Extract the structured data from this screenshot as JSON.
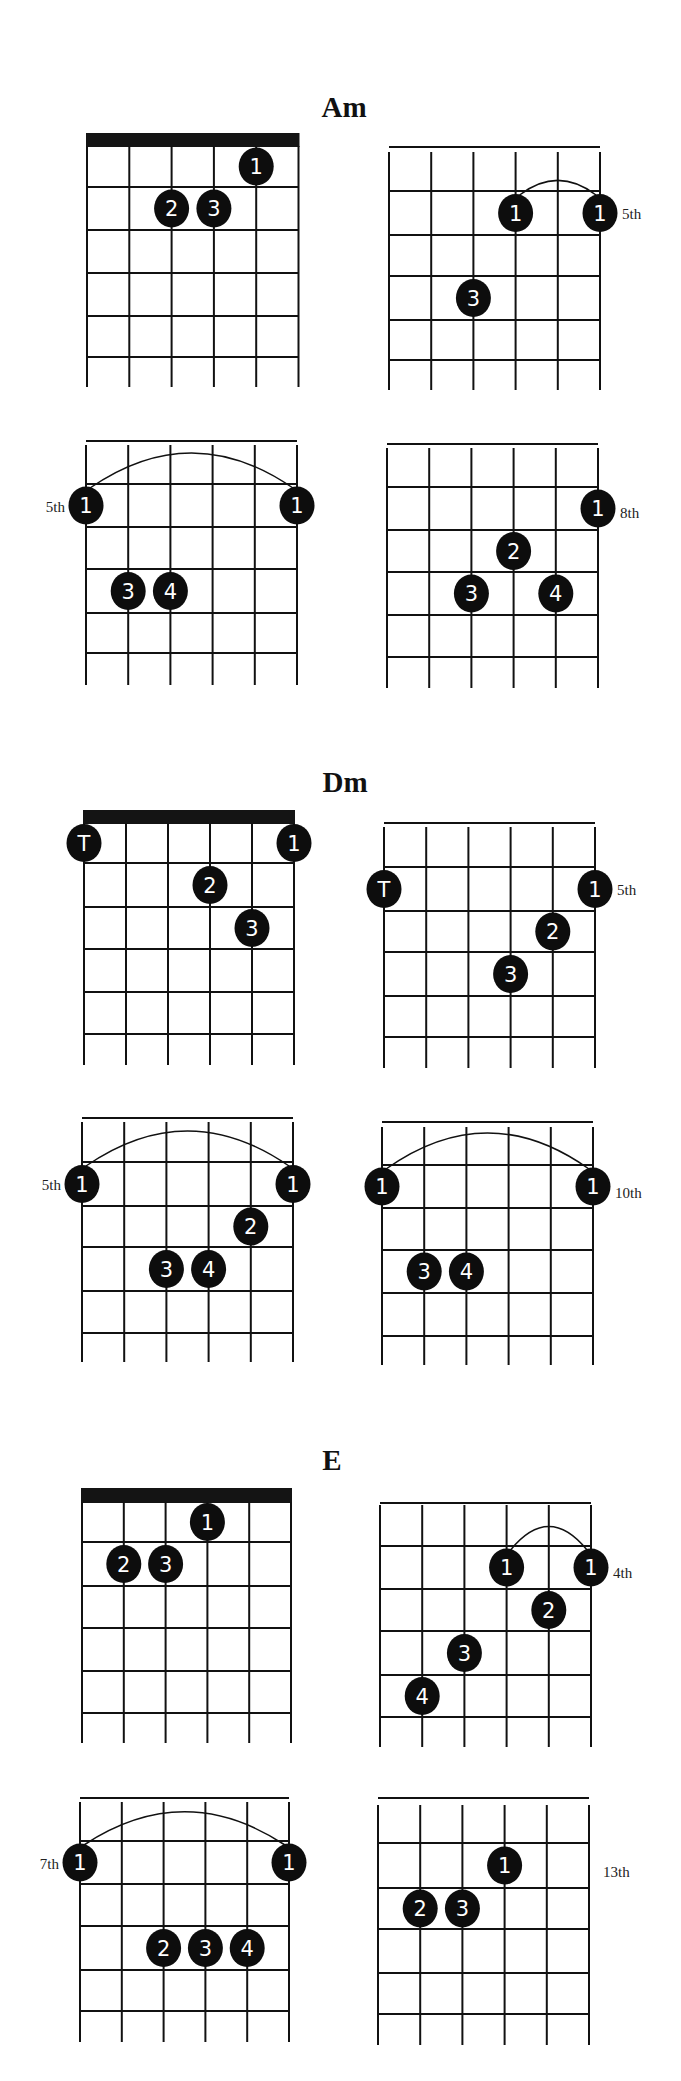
{
  "page": {
    "width": 681,
    "height": 2081,
    "ink_color": "#111111",
    "background": "#ffffff"
  },
  "sections": [
    {
      "title": "Am",
      "title_pos": {
        "x": 344,
        "y": 117
      },
      "diagrams": [
        {
          "id": "am-1",
          "x0": 87,
          "x_step": 42.3,
          "y_top": 146,
          "fret_y": [
            187,
            230,
            273,
            316,
            357
          ],
          "y_bottom": 387,
          "nut": true,
          "nut_top": 133,
          "position_label": "",
          "label_side": "none",
          "dots": [
            {
              "string": 5,
              "row": 1,
              "finger": "1"
            },
            {
              "string": 3,
              "row": 2,
              "finger": "2"
            },
            {
              "string": 4,
              "row": 2,
              "finger": "3"
            }
          ],
          "barre": null
        },
        {
          "id": "am-2",
          "x0": 389,
          "x_step": 42.2,
          "y_top": 152,
          "fret_y": [
            191,
            235,
            276,
            320,
            360
          ],
          "y_bottom": 390,
          "nut": false,
          "position_label": "5th",
          "label_side": "right",
          "label_y": 219,
          "dots": [
            {
              "string": 4,
              "row": 1,
              "finger": "1"
            },
            {
              "string": 6,
              "row": 1,
              "finger": "1"
            },
            {
              "string": 3,
              "row": 3,
              "finger": "3"
            }
          ],
          "barre": {
            "from": 4,
            "to": 6,
            "peak": 180
          }
        },
        {
          "id": "am-3",
          "x0": 86,
          "x_step": 42.2,
          "y_top": 445,
          "fret_y": [
            484,
            527,
            569,
            613,
            653
          ],
          "y_bottom": 685,
          "nut": false,
          "position_label": "5th",
          "label_side": "left",
          "label_y": 512,
          "dots": [
            {
              "string": 1,
              "row": 1,
              "finger": "1"
            },
            {
              "string": 6,
              "row": 1,
              "finger": "1"
            },
            {
              "string": 2,
              "row": 3,
              "finger": "3"
            },
            {
              "string": 3,
              "row": 3,
              "finger": "4"
            }
          ],
          "barre": {
            "from": 1,
            "to": 6,
            "peak": 452
          }
        },
        {
          "id": "am-4",
          "x0": 387,
          "x_step": 42.2,
          "y_top": 448,
          "fret_y": [
            487,
            530,
            572,
            615,
            657
          ],
          "y_bottom": 688,
          "nut": false,
          "position_label": "8th",
          "label_side": "right",
          "label_y": 518,
          "dots": [
            {
              "string": 6,
              "row": 1,
              "finger": "1"
            },
            {
              "string": 4,
              "row": 2,
              "finger": "2"
            },
            {
              "string": 3,
              "row": 3,
              "finger": "3"
            },
            {
              "string": 5,
              "row": 3,
              "finger": "4"
            }
          ],
          "barre": null
        }
      ]
    },
    {
      "title": "Dm",
      "title_pos": {
        "x": 345,
        "y": 792
      },
      "diagrams": [
        {
          "id": "dm-1",
          "x0": 84,
          "x_step": 42.0,
          "y_top": 823,
          "fret_y": [
            863,
            907,
            949,
            992,
            1034
          ],
          "y_bottom": 1065,
          "nut": true,
          "nut_top": 810,
          "position_label": "",
          "label_side": "none",
          "dots": [
            {
              "string": 1,
              "row": 1,
              "finger": "T"
            },
            {
              "string": 6,
              "row": 1,
              "finger": "1"
            },
            {
              "string": 4,
              "row": 2,
              "finger": "2"
            },
            {
              "string": 5,
              "row": 3,
              "finger": "3"
            }
          ],
          "barre": null
        },
        {
          "id": "dm-2",
          "x0": 384,
          "x_step": 42.2,
          "y_top": 827,
          "fret_y": [
            867,
            911,
            952,
            996,
            1037
          ],
          "y_bottom": 1068,
          "nut": false,
          "position_label": "5th",
          "label_side": "right",
          "label_y": 895,
          "dots": [
            {
              "string": 1,
              "row": 1,
              "finger": "T"
            },
            {
              "string": 6,
              "row": 1,
              "finger": "1"
            },
            {
              "string": 5,
              "row": 2,
              "finger": "2"
            },
            {
              "string": 4,
              "row": 3,
              "finger": "3"
            }
          ],
          "barre": null
        },
        {
          "id": "dm-3",
          "x0": 82,
          "x_step": 42.2,
          "y_top": 1122,
          "fret_y": [
            1162,
            1206,
            1247,
            1291,
            1333
          ],
          "y_bottom": 1362,
          "nut": false,
          "position_label": "5th",
          "label_side": "left",
          "label_y": 1190,
          "dots": [
            {
              "string": 1,
              "row": 1,
              "finger": "1"
            },
            {
              "string": 6,
              "row": 1,
              "finger": "1"
            },
            {
              "string": 5,
              "row": 2,
              "finger": "2"
            },
            {
              "string": 3,
              "row": 3,
              "finger": "3"
            },
            {
              "string": 4,
              "row": 3,
              "finger": "4"
            }
          ],
          "barre": {
            "from": 1,
            "to": 6,
            "peak": 1130
          }
        },
        {
          "id": "dm-4",
          "x0": 382,
          "x_step": 42.2,
          "y_top": 1127,
          "fret_y": [
            1165,
            1208,
            1250,
            1293,
            1336
          ],
          "y_bottom": 1365,
          "nut": false,
          "position_label": "10th",
          "label_side": "right",
          "label_y": 1198,
          "dots": [
            {
              "string": 1,
              "row": 1,
              "finger": "1"
            },
            {
              "string": 6,
              "row": 1,
              "finger": "1"
            },
            {
              "string": 2,
              "row": 3,
              "finger": "3"
            },
            {
              "string": 3,
              "row": 3,
              "finger": "4"
            }
          ],
          "barre": {
            "from": 1,
            "to": 6,
            "peak": 1132
          }
        }
      ]
    },
    {
      "title": "E",
      "title_pos": {
        "x": 332,
        "y": 1470
      },
      "diagrams": [
        {
          "id": "e-1",
          "x0": 82,
          "x_step": 41.8,
          "y_top": 1502,
          "fret_y": [
            1542,
            1586,
            1628,
            1671,
            1713
          ],
          "y_bottom": 1743,
          "nut": true,
          "nut_top": 1488,
          "position_label": "",
          "label_side": "none",
          "dots": [
            {
              "string": 4,
              "row": 1,
              "finger": "1"
            },
            {
              "string": 2,
              "row": 2,
              "finger": "2"
            },
            {
              "string": 3,
              "row": 2,
              "finger": "3"
            }
          ],
          "barre": null
        },
        {
          "id": "e-2",
          "x0": 380,
          "x_step": 42.2,
          "y_top": 1505,
          "fret_y": [
            1546,
            1589,
            1631,
            1675,
            1717
          ],
          "y_bottom": 1747,
          "nut": false,
          "position_label": "4th",
          "label_side": "right",
          "label_y": 1578,
          "dots": [
            {
              "string": 4,
              "row": 1,
              "finger": "1"
            },
            {
              "string": 6,
              "row": 1,
              "finger": "1"
            },
            {
              "string": 5,
              "row": 2,
              "finger": "2"
            },
            {
              "string": 3,
              "row": 3,
              "finger": "3"
            },
            {
              "string": 2,
              "row": 4,
              "finger": "4"
            }
          ],
          "barre": {
            "from": 4,
            "to": 6,
            "peak": 1526
          }
        },
        {
          "id": "e-3",
          "x0": 80,
          "x_step": 41.8,
          "y_top": 1802,
          "fret_y": [
            1841,
            1884,
            1926,
            1970,
            2011
          ],
          "y_bottom": 2042,
          "nut": false,
          "position_label": "7th",
          "label_side": "left",
          "label_y": 1869,
          "dots": [
            {
              "string": 1,
              "row": 1,
              "finger": "1"
            },
            {
              "string": 6,
              "row": 1,
              "finger": "1"
            },
            {
              "string": 3,
              "row": 3,
              "finger": "2"
            },
            {
              "string": 4,
              "row": 3,
              "finger": "3"
            },
            {
              "string": 5,
              "row": 3,
              "finger": "4"
            }
          ],
          "barre": {
            "from": 1,
            "to": 6,
            "peak": 1811
          }
        },
        {
          "id": "e-4",
          "x0": 378,
          "x_step": 42.2,
          "y_top": 1805,
          "fret_y": [
            1843,
            1888,
            1929,
            1973,
            2014
          ],
          "y_bottom": 2045,
          "nut": false,
          "position_label": "13th",
          "label_side": "far-right",
          "label_y": 1877,
          "dots": [
            {
              "string": 4,
              "row": 1,
              "finger": "1"
            },
            {
              "string": 2,
              "row": 2,
              "finger": "2"
            },
            {
              "string": 3,
              "row": 2,
              "finger": "3"
            }
          ],
          "barre": null
        }
      ]
    }
  ]
}
